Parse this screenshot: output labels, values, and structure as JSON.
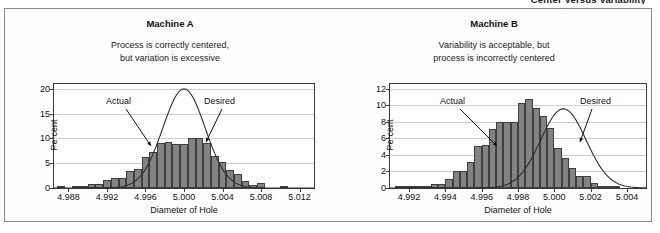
{
  "page": {
    "heading": "Center Versus Variability"
  },
  "charts": [
    {
      "id": "machine-a",
      "title": "Machine A",
      "subtitle_line1": "Process is correctly centered,",
      "subtitle_line2": "but variation is excessive",
      "annotations": {
        "actual": "Actual",
        "desired": "Desired"
      },
      "chart_data": {
        "type": "bar",
        "title": "Machine A",
        "subtitle": "Process is correctly centered, but variation is excessive",
        "xlabel": "Diameter of Hole",
        "ylabel": "Percent",
        "xlim": [
          4.9865,
          5.0135
        ],
        "ylim": [
          0,
          21
        ],
        "xticks": [
          "4.988",
          "4.992",
          "4.996",
          "5.000",
          "5.004",
          "5.008",
          "5.012"
        ],
        "xtick_values": [
          4.988,
          4.992,
          4.996,
          5.0,
          5.004,
          5.008,
          5.012
        ],
        "yticks": [
          "0",
          "5",
          "10",
          "15",
          "20"
        ],
        "ytick_values": [
          0,
          5,
          10,
          15,
          20
        ],
        "grid": true,
        "legend": "none",
        "bin_width": 0.0008,
        "categories": [
          4.9872,
          4.988,
          4.9888,
          4.9896,
          4.9904,
          4.9912,
          4.992,
          4.9928,
          4.9936,
          4.9944,
          4.9952,
          4.996,
          4.9968,
          4.9976,
          4.9984,
          4.9992,
          5.0,
          5.0008,
          5.0016,
          5.0024,
          5.0032,
          5.004,
          5.0048,
          5.0056,
          5.0064,
          5.0072,
          5.008,
          5.0088,
          5.0096,
          5.0104,
          5.0112,
          5.012
        ],
        "values": [
          0.3,
          0.0,
          0.3,
          0.5,
          0.8,
          0.9,
          1.7,
          2.0,
          2.1,
          3.4,
          3.9,
          6.2,
          7.2,
          9.0,
          9.3,
          8.9,
          8.8,
          10.1,
          10.1,
          9.0,
          6.5,
          5.3,
          3.6,
          2.9,
          1.4,
          0.7,
          1.0,
          0.0,
          0.0,
          0.4,
          0.0,
          0.0
        ],
        "series": [
          {
            "name": "Actual",
            "type": "bar",
            "label_at": 4.9968
          },
          {
            "name": "Desired",
            "type": "line",
            "curve": "normal",
            "mean": 5.0,
            "sd": 0.0022,
            "peak_percent": 20.0,
            "label_at": 5.002
          }
        ],
        "annotations": [
          {
            "text": "Actual",
            "points_to": 4.9966
          },
          {
            "text": "Desired",
            "points_to": 5.0018
          }
        ]
      }
    },
    {
      "id": "machine-b",
      "title": "Machine B",
      "subtitle_line1": "Variability is acceptable, but",
      "subtitle_line2": "process is incorrectly centered",
      "annotations": {
        "actual": "Actual",
        "desired": "Desired"
      },
      "chart_data": {
        "type": "bar",
        "title": "Machine B",
        "subtitle": "Variability is acceptable, but process is incorrectly centered",
        "xlabel": "Diameter of Hole",
        "ylabel": "Percent",
        "xlim": [
          4.99095,
          5.00505
        ],
        "ylim": [
          0,
          12.6
        ],
        "xticks": [
          "4.992",
          "4.994",
          "4.996",
          "4.998",
          "5.000",
          "5.002",
          "5.004"
        ],
        "xtick_values": [
          4.992,
          4.994,
          4.996,
          4.998,
          5.0,
          5.002,
          5.004
        ],
        "yticks": [
          "0",
          "2",
          "4",
          "6",
          "8",
          "10",
          "12"
        ],
        "ytick_values": [
          0,
          2,
          4,
          6,
          8,
          10,
          12
        ],
        "grid": true,
        "legend": "none",
        "bin_width": 0.0004,
        "categories": [
          4.9914,
          4.9918,
          4.9922,
          4.9926,
          4.993,
          4.9934,
          4.9938,
          4.9942,
          4.9946,
          4.995,
          4.9954,
          4.9958,
          4.9962,
          4.9966,
          4.997,
          4.9974,
          4.9978,
          4.9982,
          4.9986,
          4.999,
          4.9994,
          4.9998,
          5.0002,
          5.0006,
          5.001,
          5.0014,
          5.0018,
          5.0022,
          5.0026,
          5.003,
          5.0034,
          5.0038,
          5.0042
        ],
        "values": [
          0.1,
          0.1,
          0.1,
          0.1,
          0.2,
          0.5,
          0.5,
          1.1,
          2.1,
          2.1,
          3.2,
          5.1,
          5.2,
          7.1,
          8.0,
          8.0,
          8.0,
          10.3,
          10.8,
          9.7,
          8.7,
          7.3,
          4.9,
          3.6,
          2.4,
          1.4,
          1.4,
          0.6,
          0.3,
          0.2,
          0.1,
          0.0,
          0.0
        ],
        "series": [
          {
            "name": "Actual",
            "type": "bar",
            "label_at": 4.9962
          },
          {
            "name": "Desired",
            "type": "line",
            "curve": "normal",
            "mean": 5.0005,
            "sd": 0.00125,
            "peak_percent": 9.6,
            "label_at": 5.0032
          }
        ],
        "annotations": [
          {
            "text": "Actual",
            "points_to": 4.9962
          },
          {
            "text": "Desired",
            "points_to": 5.0024
          }
        ]
      }
    }
  ]
}
